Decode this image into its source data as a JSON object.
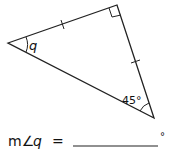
{
  "diagram": {
    "angle_label": "q",
    "given_angle": "45°",
    "vertices": {
      "left": [
        8,
        43
      ],
      "top": [
        117,
        5
      ],
      "bottom": [
        154,
        118
      ]
    },
    "marks": [
      "right-angle at top vertex",
      "tick on top-left side",
      "tick on top-bottom side"
    ]
  },
  "question": {
    "prefix": "m∠",
    "variable": "q",
    "equals": "=",
    "degree": "°"
  },
  "colors": {
    "stroke": "#222222",
    "text": "#111111"
  }
}
